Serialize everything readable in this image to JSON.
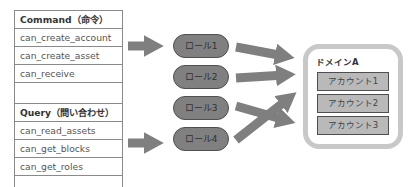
{
  "command_table": {
    "header": "Command（命令）",
    "items": [
      "can_create_account",
      "can_create_asset",
      "can_receive"
    ]
  },
  "query_table": {
    "header": "Query（問い合わせ）",
    "items": [
      "can_read_assets",
      "can_get_blocks",
      "can_get_roles"
    ]
  },
  "roles": [
    "ロール1",
    "ロール2",
    "ロール3",
    "ロール4"
  ],
  "domain": {
    "title": "ドメインA",
    "accounts": [
      "アカウント1",
      "アカウント2",
      "アカウント3"
    ]
  },
  "colors": {
    "arrow": "#7f7f7f",
    "role_fill": "#808080",
    "account_fill": "#b9b9b9",
    "domain_border": "#c8c8c8"
  }
}
